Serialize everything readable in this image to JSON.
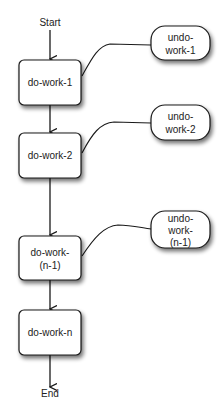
{
  "diagram": {
    "start_label": "Start",
    "end_label": "End",
    "do_nodes": [
      {
        "id": "do-work-1",
        "lines": [
          "do-work-1"
        ]
      },
      {
        "id": "do-work-2",
        "lines": [
          "do-work-2"
        ]
      },
      {
        "id": "do-work-n-1",
        "lines": [
          "do-work-",
          "(n-1)"
        ]
      },
      {
        "id": "do-work-n",
        "lines": [
          "do-work-n"
        ]
      }
    ],
    "undo_nodes": [
      {
        "id": "undo-work-1",
        "lines": [
          "undo-",
          "work-1"
        ]
      },
      {
        "id": "undo-work-2",
        "lines": [
          "undo-",
          "work-2"
        ]
      },
      {
        "id": "undo-work-n-1",
        "lines": [
          "undo-",
          "work-",
          "(n-1)"
        ]
      }
    ],
    "colors": {
      "stroke": "#1a1a1a",
      "fill": "#ffffff",
      "text": "#222222",
      "shadow": "#888888"
    }
  }
}
